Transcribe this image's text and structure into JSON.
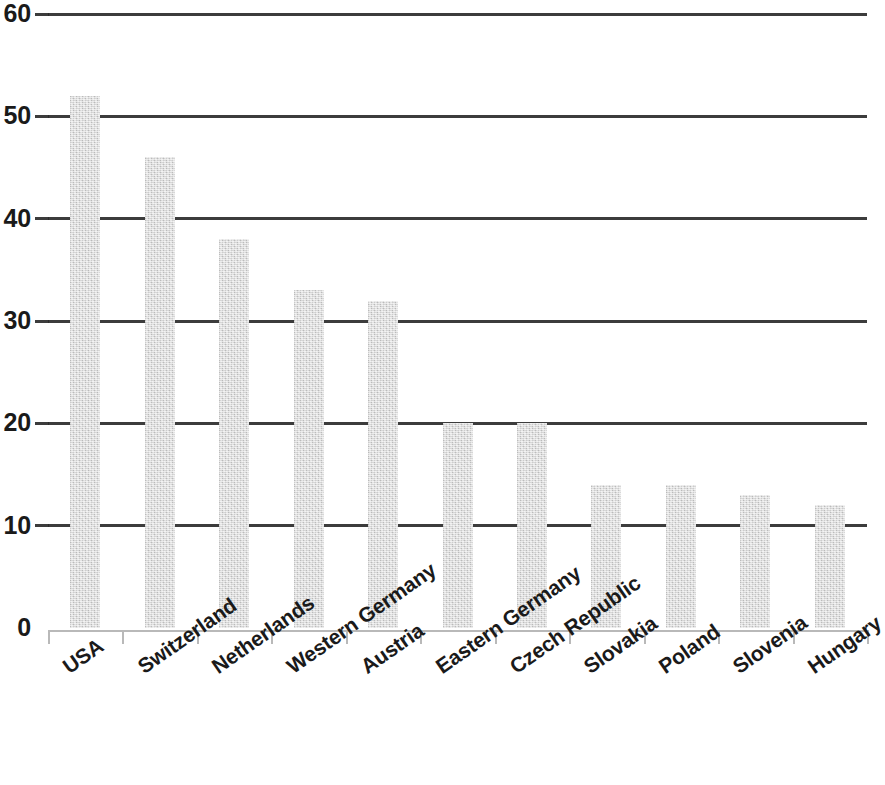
{
  "chart_data": {
    "type": "bar",
    "title": "",
    "subtitle": "",
    "xlabel": "",
    "ylabel": "",
    "ylim": [
      0,
      60
    ],
    "yticks": [
      0,
      10,
      20,
      30,
      40,
      50,
      60
    ],
    "ytick_labels": [
      "0",
      "10",
      "20",
      "30",
      "40",
      "50",
      "60"
    ],
    "grid": true,
    "legend": false,
    "legend_position": "none",
    "bar_color": "#cdcdcd",
    "gridline_color": "#2b2b2b",
    "axis_color": "#b9b9b9",
    "label_rotation": -35,
    "categories": [
      "USA",
      "Switzerland",
      "Netherlands",
      "Western Germany",
      "Austria",
      "Eastern Germany",
      "Czech Republic",
      "Slovakia",
      "Poland",
      "Slovenia",
      "Hungary"
    ],
    "values": [
      52,
      46,
      38,
      33,
      32,
      20,
      20,
      14,
      14,
      13,
      12
    ],
    "series": [
      {
        "name": "",
        "values": [
          52,
          46,
          38,
          33,
          32,
          20,
          20,
          14,
          14,
          13,
          12
        ]
      }
    ]
  }
}
